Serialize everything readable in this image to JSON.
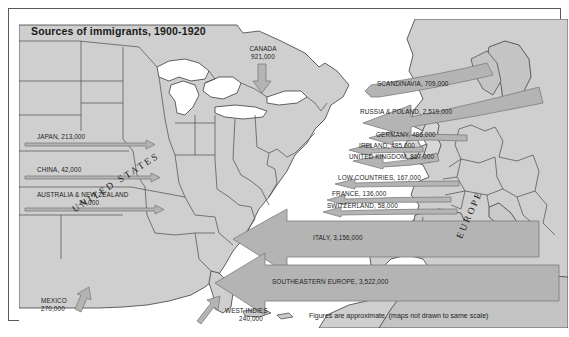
{
  "title": "Sources of immigrants, 1900-1920",
  "footnote": "Figures are approximate.  (maps not drawn to same scale)",
  "continents": [
    {
      "name": "UNITED STATES"
    },
    {
      "name": "EUROPE"
    }
  ],
  "flows": [
    {
      "id": "canada",
      "label": "CANADA",
      "value": "921,000",
      "text": "CANADA 921,000",
      "direction": "south"
    },
    {
      "id": "japan",
      "label": "JAPAN",
      "value": "213,000",
      "text": "JAPAN, 213,000",
      "direction": "east"
    },
    {
      "id": "china",
      "label": "CHINA",
      "value": "42,000",
      "text": "CHINA, 42,000",
      "direction": "east"
    },
    {
      "id": "australia-nz",
      "label": "AUSTRALIA & NEW ZEALAND",
      "value": "24,000",
      "text": "AUSTRALIA & NEW ZEALAND 24,000",
      "direction": "east"
    },
    {
      "id": "mexico",
      "label": "MEXICO",
      "value": "270,000",
      "text": "MEXICO 270,000",
      "direction": "northeast"
    },
    {
      "id": "west-indies",
      "label": "WEST INDIES",
      "value": "240,000",
      "text": "WEST INDIES 240,000",
      "direction": "northwest"
    },
    {
      "id": "scandinavia",
      "label": "SCANDINAVIA",
      "value": "709,000",
      "text": "SCANDINAVIA, 709,000",
      "direction": "west"
    },
    {
      "id": "russia-poland",
      "label": "RUSSIA & POLAND",
      "value": "2,519,000",
      "text": "RUSSIA & POLAND, 2,519,000",
      "direction": "west"
    },
    {
      "id": "germany",
      "label": "GERMANY",
      "value": "486,000",
      "text": "GERMANY, 486,000",
      "direction": "west"
    },
    {
      "id": "ireland",
      "label": "IRELAND",
      "value": "485,000",
      "text": "IRELAND, 485,000",
      "direction": "west"
    },
    {
      "id": "united-kingdom",
      "label": "UNITED KINGDOM",
      "value": "867,000",
      "text": "UNITED KINGDOM, 867,000",
      "direction": "west"
    },
    {
      "id": "low-countries",
      "label": "LOW COUNTRIES",
      "value": "167,000",
      "text": "LOW COUNTRIES, 167,000",
      "direction": "west"
    },
    {
      "id": "france",
      "label": "FRANCE",
      "value": "136,000",
      "text": "FRANCE, 136,000",
      "direction": "west"
    },
    {
      "id": "switzerland",
      "label": "SWITZERLAND",
      "value": "58,000",
      "text": "SWITZERLAND, 58,000",
      "direction": "west"
    },
    {
      "id": "italy",
      "label": "ITALY",
      "value": "3,156,000",
      "text": "ITALY, 3,156,000",
      "direction": "west"
    },
    {
      "id": "se-europe",
      "label": "SOUTHEASTERN EUROPE",
      "value": "3,522,000",
      "text": "SOUTHEASTERN EUROPE, 3,522,000",
      "direction": "west"
    }
  ],
  "labels": {
    "canada_l1": "CANADA",
    "canada_l2": "921,000",
    "mexico_l1": "MEXICO",
    "mexico_l2": "270,000",
    "windies_l1": "WEST INDIES",
    "windies_l2": "240,000",
    "japan": "JAPAN, 213,000",
    "china": "CHINA, 42,000",
    "anz_l1": "AUSTRALIA & NEW ZEALAND",
    "anz_l2": "24,000",
    "scandinavia": "SCANDINAVIA, 709,000",
    "russia_poland": "RUSSIA & POLAND, 2,519,000",
    "germany": "GERMANY, 486,000",
    "ireland": "IRELAND, 485,000",
    "united_kingdom": "UNITED KINGDOM, 867,000",
    "low_countries": "LOW COUNTRIES, 167,000",
    "france": "FRANCE, 136,000",
    "switzerland": "SWITZERLAND, 58,000",
    "italy": "ITALY, 3,156,000",
    "se_europe": "SOUTHEASTERN EUROPE, 3,522,000",
    "united_states": "UNITED STATES",
    "europe": "EUROPE"
  },
  "colors": {
    "land": "#cfcfcf",
    "water": "#ffffff",
    "arrow_fill": "#b4b4b4",
    "arrow_stroke": "#7c7c7c",
    "border": "#5a5a5a",
    "text": "#1c1c1c"
  }
}
